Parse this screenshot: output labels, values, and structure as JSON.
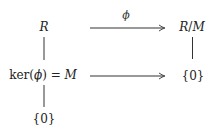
{
  "diagram": {
    "type": "commutative-diagram",
    "colors": {
      "background": "#ffffff",
      "ink": "#222222",
      "line": "#333333"
    },
    "nodes": {
      "R": {
        "label": "R",
        "x": 44,
        "y": 27
      },
      "RM": {
        "label_R": "R",
        "slash": "/",
        "label_M": "M",
        "x": 192,
        "y": 27
      },
      "ker": {
        "prefix": "ker(",
        "phi": "ϕ",
        "suffix": ") = ",
        "M": "M",
        "x": 43,
        "y": 75
      },
      "zero_right": {
        "label": "{0}",
        "x": 193,
        "y": 76
      },
      "zero_bottom": {
        "label": "{0}",
        "x": 44,
        "y": 119
      }
    },
    "edges": [
      {
        "from": "R",
        "to": "RM",
        "kind": "arrow",
        "label": "ϕ"
      },
      {
        "from": "ker",
        "to": "zero_right",
        "kind": "arrow",
        "label": ""
      },
      {
        "from": "R",
        "to": "ker",
        "kind": "line",
        "label": ""
      },
      {
        "from": "RM",
        "to": "zero_right",
        "kind": "line",
        "label": ""
      },
      {
        "from": "ker",
        "to": "zero_bottom",
        "kind": "line",
        "label": ""
      }
    ],
    "arrow_label_phi": "ϕ"
  }
}
